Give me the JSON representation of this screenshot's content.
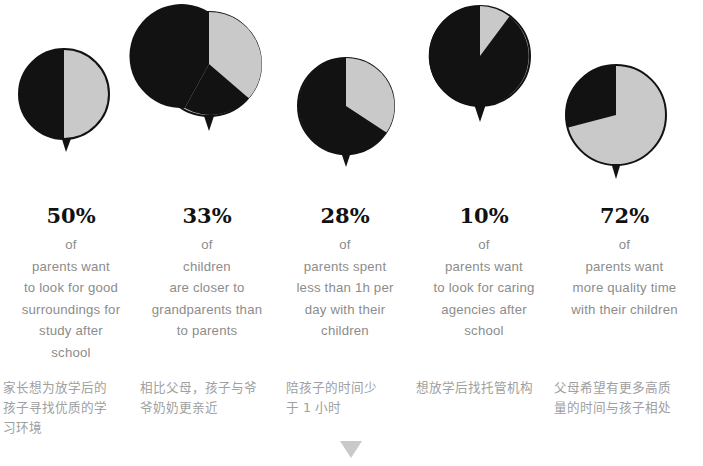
{
  "chart_data": {
    "type": "pie",
    "title": "",
    "legend": "none",
    "series_labels": [
      "highlighted share",
      "remainder"
    ],
    "colors": {
      "highlight_gray": "#c9c9c9",
      "dark": "#121212",
      "text_gray": "#8c8c8c",
      "zh_gray": "#a0a0a0",
      "arrow_gray": "#c9c9c9"
    },
    "charts": [
      {
        "index": 1,
        "percent": 50,
        "value_label": "50%",
        "gray_share": 50,
        "dark_share": 50,
        "gray_is_highlight": true,
        "start_angle_deg": 0
      },
      {
        "index": 2,
        "percent": 33,
        "value_label": "33%",
        "gray_share": 33,
        "dark_share": 67,
        "gray_is_highlight": true,
        "start_angle_deg": 0
      },
      {
        "index": 3,
        "percent": 28,
        "value_label": "28%",
        "gray_share": 28,
        "dark_share": 72,
        "gray_is_highlight": true,
        "start_angle_deg": 0
      },
      {
        "index": 4,
        "percent": 10,
        "value_label": "10%",
        "gray_share": 10,
        "dark_share": 90,
        "gray_is_highlight": true,
        "start_angle_deg": 0
      },
      {
        "index": 5,
        "percent": 72,
        "value_label": "72%",
        "gray_share": 72,
        "dark_share": 28,
        "gray_is_highlight": true,
        "start_angle_deg": 0
      }
    ]
  },
  "columns": [
    {
      "percent_label": "50%",
      "description_lines": [
        "of",
        "parents want",
        "to look for good",
        "surroundings for",
        "study  after",
        "school"
      ],
      "chinese_lines": [
        "家长想为放学后的",
        "孩子寻找优质的学",
        "习环境"
      ]
    },
    {
      "percent_label": "33%",
      "description_lines": [
        "of",
        "children",
        "are closer to",
        "grandparents than",
        "to parents"
      ],
      "chinese_lines": [
        "相比父母，孩子与爷",
        "爷奶奶更亲近"
      ]
    },
    {
      "percent_label": "28%",
      "description_lines": [
        "of",
        "parents spent",
        "less than 1h per",
        "day with their",
        "children"
      ],
      "chinese_lines": [
        "陪孩子的时间少",
        "于 1 小时"
      ]
    },
    {
      "percent_label": "10%",
      "description_lines": [
        "of",
        "parents want",
        "to look for caring",
        "agencies after",
        "school"
      ],
      "chinese_lines": [
        "想放学后找托管机构"
      ]
    },
    {
      "percent_label": "72%",
      "description_lines": [
        "of",
        "parents want",
        "more quality time",
        "with their children"
      ],
      "chinese_lines": [
        "父母希望有更多高质",
        "量的时间与孩子相处"
      ]
    }
  ],
  "footer": {
    "arrow_icon": "triangle-down-icon"
  }
}
